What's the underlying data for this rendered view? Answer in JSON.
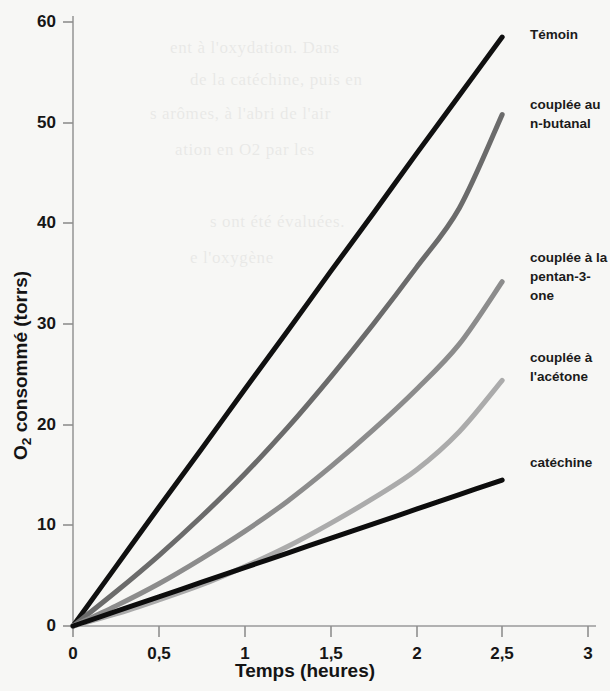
{
  "chart_data": {
    "type": "line",
    "title": "",
    "xlabel": "Temps (heures)",
    "ylabel": "O2 consommé (torrs)",
    "ylabel_html": "O₂ consommé (torrs)",
    "xlim": [
      0,
      3
    ],
    "ylim": [
      0,
      62
    ],
    "xticks": [
      "0",
      "0,5",
      "1",
      "1,5",
      "2",
      "2,5",
      "3"
    ],
    "xtick_values": [
      0,
      0.5,
      1,
      1.5,
      2,
      2.5,
      3
    ],
    "yticks": [
      "0",
      "10",
      "20",
      "30",
      "40",
      "50",
      "60"
    ],
    "ytick_values": [
      0,
      10,
      20,
      30,
      40,
      50,
      60
    ],
    "grid": false,
    "legend_position": "right-inline-labels",
    "x": [
      0,
      0.25,
      0.5,
      0.75,
      1,
      1.25,
      1.5,
      1.75,
      2,
      2.25,
      2.5
    ],
    "series": [
      {
        "name": "Témoin",
        "color": "#101010",
        "width": 5,
        "values": [
          0,
          5.9,
          11.8,
          17.6,
          23.5,
          29.3,
          35.2,
          41.0,
          46.9,
          52.7,
          58.5
        ]
      },
      {
        "name": "couplée au n-butanal",
        "color": "#6b6b6b",
        "width": 5,
        "values": [
          0,
          3.4,
          7.0,
          10.9,
          15.1,
          19.7,
          24.7,
          30.0,
          35.6,
          41.5,
          50.8
        ]
      },
      {
        "name": "couplée à la pentan-3-one",
        "color": "#8c8c8c",
        "width": 5,
        "values": [
          0,
          2.0,
          4.2,
          6.7,
          9.4,
          12.4,
          15.8,
          19.5,
          23.5,
          28.0,
          34.2
        ]
      },
      {
        "name": "couplée à l'acétone",
        "color": "#ababab",
        "width": 5,
        "values": [
          0,
          1.2,
          2.6,
          4.1,
          5.9,
          7.9,
          10.2,
          12.7,
          15.5,
          19.3,
          24.4
        ]
      },
      {
        "name": "catéchine",
        "color": "#0d0d0d",
        "width": 5,
        "values": [
          0,
          1.45,
          2.9,
          4.35,
          5.8,
          7.25,
          8.7,
          10.15,
          11.6,
          13.05,
          14.5
        ]
      }
    ],
    "annotations": [
      {
        "text": "Témoin",
        "x": 2.53,
        "y": 58.6
      },
      {
        "text": "couplée au\nn-butanal",
        "x": 2.53,
        "y": 54.0
      },
      {
        "text": "couplée à la\npentan-3-one",
        "x": 2.53,
        "y": 39.0
      },
      {
        "text": "couplée à\nl'acétone",
        "x": 2.53,
        "y": 29.5
      },
      {
        "text": "catéchine",
        "x": 2.53,
        "y": 19.0
      }
    ]
  },
  "labels": {
    "ytitle_main": " consommé (torrs)",
    "ytitle_element": "O",
    "ytitle_sub": "2",
    "xtitle": "Temps (heures)",
    "series_temoin": "Témoin",
    "series_butanal": "couplée au\nn-butanal",
    "series_pentanone": "couplée à la\npentan-3-one",
    "series_acetone": "couplée à\nl'acétone",
    "series_catechine": "catéchine"
  },
  "yticks": {
    "t0": "0",
    "t10": "10",
    "t20": "20",
    "t30": "30",
    "t40": "40",
    "t50": "50",
    "t60": "60"
  },
  "xticks": {
    "t0": "0",
    "t05": "0,5",
    "t1": "1",
    "t15": "1,5",
    "t2": "2",
    "t25": "2,5",
    "t3": "3"
  },
  "bleed_text": {
    "l1": "ent à l'oxydation. Dans",
    "l2": "de la catéchine, puis en",
    "l3": "s arômes, à l'abri de l'air",
    "l4": "ation en O2 par les",
    "l5": "s ont été évaluées.",
    "l6": "e l'oxygène"
  }
}
